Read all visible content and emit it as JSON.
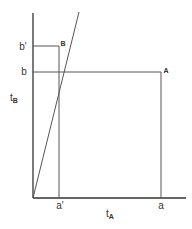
{
  "diagram": {
    "colors": {
      "line": "#555555",
      "axis": "#333333",
      "text": "#333333"
    },
    "axes": {
      "x_label": "t",
      "x_label_sub": "A",
      "y_label": "t",
      "y_label_sub": "B"
    },
    "ticks": {
      "x": [
        {
          "label": "a'"
        },
        {
          "label": "a"
        }
      ],
      "y": [
        {
          "label": "b'"
        },
        {
          "label": "b"
        }
      ]
    },
    "points": [
      {
        "label": "A"
      },
      {
        "label": "B"
      }
    ]
  }
}
